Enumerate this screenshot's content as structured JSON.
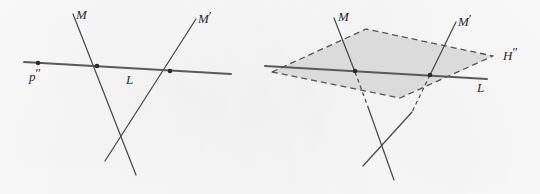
{
  "figure": {
    "background_color": "#fcfcfc",
    "ink_color": "#4a4a4a",
    "label_color": "#2b2b2b",
    "plane_fill_color": "#d9d9d9",
    "plane_edge_color": "#555555",
    "panels": [
      {
        "id": "left",
        "name": "lines-and-point-panel",
        "labels": {
          "line_m": "M",
          "line_m_prime_base": "M",
          "line_m_prime_mark": "′",
          "line_l": "L",
          "point_p_base": "p",
          "point_p_mark": "″"
        },
        "points": [
          {
            "name": "point-p-double-prime",
            "label": "p″",
            "x": 38,
            "y": 64
          },
          {
            "name": "intersection-m-l",
            "label": "",
            "x": 97,
            "y": 68
          },
          {
            "name": "intersection-mprime-l",
            "label": "",
            "x": 170,
            "y": 71
          }
        ],
        "lines": [
          {
            "name": "line-L",
            "label": "L",
            "x1": 24,
            "y1": 62,
            "x2": 231,
            "y2": 74
          },
          {
            "name": "line-M",
            "label": "M",
            "x1": 73,
            "y1": 14,
            "x2": 136,
            "y2": 175
          },
          {
            "name": "line-M-prime",
            "label": "M′",
            "x1": 196,
            "y1": 19,
            "x2": 105,
            "y2": 161
          }
        ]
      },
      {
        "id": "right",
        "name": "plane-with-lines-panel",
        "labels": {
          "line_m": "M",
          "line_m_prime_base": "M",
          "line_m_prime_mark": "′",
          "line_l": "L",
          "plane_base": "H",
          "plane_mark": "″"
        },
        "points": [
          {
            "name": "intersection-m-l",
            "label": "",
            "x": 355,
            "y": 72
          },
          {
            "name": "intersection-mprime-l",
            "label": "",
            "x": 430,
            "y": 75
          }
        ],
        "lines": [
          {
            "name": "line-L",
            "label": "L",
            "x1": 265,
            "y1": 66,
            "x2": 487,
            "y2": 79
          },
          {
            "name": "line-M",
            "label": "M",
            "x1": 334,
            "y1": 18,
            "x2": 394,
            "y2": 180
          },
          {
            "name": "line-M-prime",
            "label": "M′",
            "x1": 456,
            "y1": 22,
            "x2": 363,
            "y2": 166
          }
        ],
        "plane": {
          "name": "plane-H-double-prime",
          "label": "H″",
          "style": "dashed-outline-filled-parallelogram",
          "vertices": [
            {
              "x": 272,
              "y": 72
            },
            {
              "x": 366,
              "y": 29
            },
            {
              "x": 493,
              "y": 56
            },
            {
              "x": 400,
              "y": 98
            }
          ]
        }
      }
    ]
  }
}
